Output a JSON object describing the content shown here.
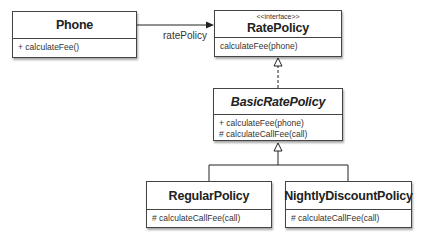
{
  "diagram": {
    "type": "UML class diagram",
    "classes": [
      {
        "id": "phone",
        "name": "Phone",
        "stereotype": "",
        "abstract": false,
        "operations": [
          "+ calculateFee()"
        ]
      },
      {
        "id": "rate_policy",
        "name": "RatePolicy",
        "stereotype": "<<interface>>",
        "abstract": false,
        "operations": [
          "calculateFee(phone)"
        ]
      },
      {
        "id": "basic_rate_policy",
        "name": "BasicRatePolicy",
        "stereotype": "",
        "abstract": true,
        "operations": [
          "+ calculateFee(phone)",
          "# calculateCallFee(call)"
        ]
      },
      {
        "id": "regular_policy",
        "name": "RegularPolicy",
        "stereotype": "",
        "abstract": false,
        "operations": [
          "# calculateCallFee(call)"
        ]
      },
      {
        "id": "nightly_discount_policy",
        "name": "NightlyDiscountPolicy",
        "stereotype": "",
        "abstract": false,
        "operations": [
          "# calculateCallFee(call)"
        ]
      }
    ],
    "relations": [
      {
        "from": "Phone",
        "to": "RatePolicy",
        "kind": "association",
        "label": "ratePolicy"
      },
      {
        "from": "BasicRatePolicy",
        "to": "RatePolicy",
        "kind": "realization"
      },
      {
        "from": "RegularPolicy",
        "to": "BasicRatePolicy",
        "kind": "generalization"
      },
      {
        "from": "NightlyDiscountPolicy",
        "to": "BasicRatePolicy",
        "kind": "generalization"
      }
    ]
  }
}
